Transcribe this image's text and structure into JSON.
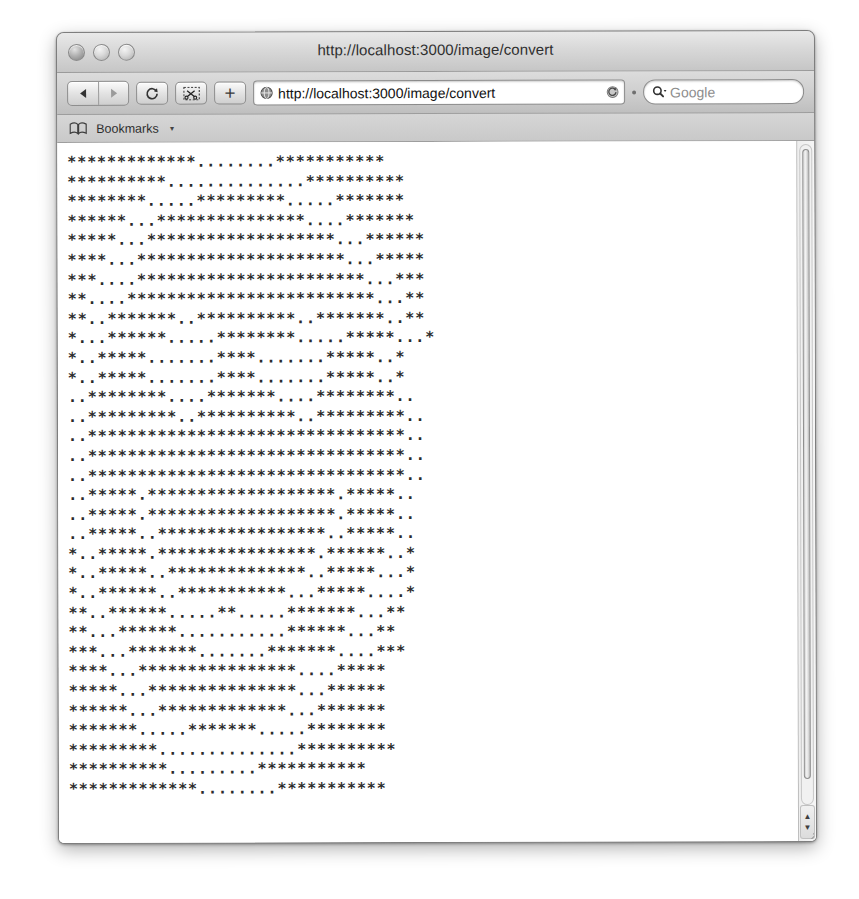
{
  "window": {
    "title": "http://localhost:3000/image/convert",
    "traffic_lights": [
      "close",
      "minimize",
      "zoom"
    ]
  },
  "toolbar": {
    "back_icon": "back-arrow-icon",
    "forward_icon": "forward-arrow-icon",
    "reload_icon": "reload-icon",
    "snip_icon": "scissors-icon",
    "add_tab_label": "+",
    "url_site_icon": "globe-icon",
    "url_value": "http://localhost:3000/image/convert",
    "url_reload_icon": "reload-small-icon",
    "search_icon": "magnifier-icon",
    "search_placeholder": "Google",
    "search_value": ""
  },
  "bookmarks_bar": {
    "book_icon": "open-book-icon",
    "label": "Bookmarks",
    "caret": "▾"
  },
  "scrollbar": {
    "up_arrow": "▲",
    "down_arrow": "▼",
    "position_percent": 0
  },
  "page": {
    "content_type": "ascii-art",
    "charset": [
      "*",
      "."
    ],
    "columns": 33,
    "rows": 33,
    "ascii_lines": [
      "*************........***********",
      "**********..............**********",
      "********.....*********.....*******",
      "******...***************....*******",
      "*****...*******************...******",
      "****...*********************...*****",
      "***....***********************...***",
      "**....*************************...**",
      "**..*******..**********..*******..**",
      "*...******.....********.....*****...*",
      "*..*****.......****.......*****..*",
      "*..*****.......****.......*****..*",
      "..********....*******....********..",
      "..*********..**********..*********..",
      "..********************************..",
      "..********************************..",
      "..********************************..",
      "..*****.*******************.*****..",
      "..*****.*******************.*****..",
      "..*****..*****************..*****..",
      "*..*****.****************.******..*",
      "*..*****..**************..*****...*",
      "*..******..***********...*****....*",
      "**..******.....**.....*******...**",
      "**...******...........******...**",
      "***...*******.......*******....***",
      "****...****************....*****",
      "*****...***************...******",
      "******...*************...*******",
      "*******.....*******.....********",
      "*********..............**********",
      "**********.........***********",
      "*************........***********"
    ]
  }
}
